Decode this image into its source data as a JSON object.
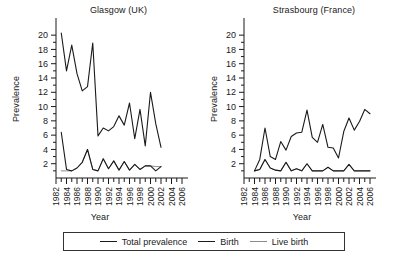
{
  "figure": {
    "legend": {
      "entries": [
        {
          "label": "Total prevalence",
          "color": "#1a1a1a",
          "width": 1.6
        },
        {
          "label": "Birth",
          "color": "#1a1a1a",
          "width": 1.6
        },
        {
          "label": "Live birth",
          "color": "#8c8c8c",
          "width": 1.2
        }
      ]
    }
  },
  "chart_data": [
    {
      "type": "line",
      "title": "Glasgow (UK)",
      "xlabel": "Year",
      "ylabel": "Prevalence",
      "xlim": [
        1982,
        2006
      ],
      "ylim": [
        0,
        21
      ],
      "yticks": [
        2,
        4,
        6,
        8,
        10,
        12,
        14,
        16,
        18,
        20
      ],
      "xticks": [
        1982,
        1984,
        1986,
        1988,
        1990,
        1992,
        1994,
        1996,
        1998,
        2000,
        2002,
        2004,
        2006
      ],
      "xtick_minor_step": 1,
      "grid": false,
      "legend_position": "below-figure",
      "x": [
        1983,
        1984,
        1985,
        1986,
        1987,
        1988,
        1989,
        1990,
        1991,
        1992,
        1993,
        1994,
        1995,
        1996,
        1997,
        1998,
        1999,
        2000,
        2001,
        2002
      ],
      "series": [
        {
          "name": "Total prevalence",
          "color": "#1a1a1a",
          "values": [
            20.3,
            15.0,
            18.6,
            14.6,
            12.2,
            12.8,
            18.9,
            5.9,
            7.0,
            6.6,
            7.2,
            8.7,
            7.4,
            10.5,
            5.5,
            9.6,
            4.5,
            12.0,
            7.6,
            4.3
          ]
        },
        {
          "name": "Birth",
          "color": "#1a1a1a",
          "values": [
            6.4,
            1.2,
            1.0,
            1.4,
            2.2,
            4.0,
            1.2,
            1.0,
            2.7,
            1.3,
            2.4,
            1.1,
            2.3,
            1.1,
            1.9,
            1.2,
            1.7,
            1.7,
            1.0,
            1.6
          ]
        },
        {
          "name": "Live birth",
          "color": "#8c8c8c",
          "values": [
            1.0,
            1.0,
            1.0,
            1.4,
            2.2,
            4.0,
            1.2,
            1.0,
            2.7,
            1.3,
            2.4,
            1.1,
            2.3,
            1.1,
            1.9,
            1.2,
            1.7,
            1.7,
            1.6,
            1.6
          ]
        }
      ]
    },
    {
      "type": "line",
      "title": "Strasbourg (France)",
      "xlabel": "Year",
      "ylabel": "Prevalence",
      "xlim": [
        1982,
        2006
      ],
      "ylim": [
        0,
        21
      ],
      "yticks": [
        2,
        4,
        6,
        8,
        10,
        12,
        14,
        16,
        18,
        20
      ],
      "xticks": [
        1982,
        1984,
        1986,
        1988,
        1990,
        1992,
        1994,
        1996,
        1998,
        2000,
        2002,
        2004,
        2006
      ],
      "xtick_minor_step": 1,
      "grid": false,
      "legend_position": "below-figure",
      "x": [
        1984,
        1985,
        1986,
        1987,
        1988,
        1989,
        1990,
        1991,
        1992,
        1993,
        1994,
        1995,
        1996,
        1997,
        1998,
        1999,
        2000,
        2001,
        2002,
        2003,
        2004,
        2005,
        2006
      ],
      "series": [
        {
          "name": "Total prevalence",
          "color": "#1a1a1a",
          "values": [
            1.0,
            2.6,
            7.0,
            3.0,
            2.6,
            5.1,
            3.9,
            5.8,
            6.3,
            6.4,
            9.5,
            5.7,
            5.0,
            7.5,
            4.3,
            4.2,
            2.8,
            6.5,
            8.4,
            6.7,
            7.9,
            9.6,
            9.0
          ]
        },
        {
          "name": "Birth",
          "color": "#1a1a1a",
          "values": [
            1.0,
            1.2,
            2.6,
            1.4,
            1.1,
            1.0,
            2.2,
            1.0,
            1.3,
            1.0,
            2.0,
            1.0,
            1.0,
            1.0,
            1.5,
            1.0,
            1.0,
            1.0,
            1.9,
            1.0,
            1.0,
            1.0,
            1.0
          ]
        },
        {
          "name": "Live birth",
          "color": "#8c8c8c",
          "values": [
            1.0,
            1.2,
            2.6,
            1.4,
            1.1,
            1.0,
            2.2,
            1.0,
            1.3,
            1.0,
            2.0,
            1.0,
            1.0,
            1.0,
            1.5,
            1.0,
            1.0,
            1.0,
            1.9,
            1.0,
            1.0,
            1.0,
            1.0
          ]
        }
      ]
    }
  ]
}
